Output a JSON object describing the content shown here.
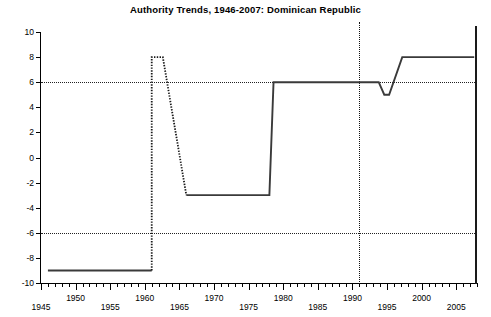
{
  "chart_data": {
    "type": "line",
    "title": "Authority Trends, 1946-2007: Dominican Republic",
    "xlabel": "",
    "ylabel": "",
    "xlim": [
      1945,
      2008
    ],
    "ylim": [
      -10,
      10
    ],
    "grid": "horizontal dotted at +6 and -6",
    "legend": "none",
    "y_ticks": [
      10,
      8,
      6,
      4,
      2,
      0,
      -2,
      -4,
      -6,
      -8,
      -10
    ],
    "y_tick_labels": [
      "10",
      "8",
      "6",
      "4",
      "2",
      "0",
      "-2",
      "-4",
      "-6",
      "-8",
      "-10"
    ],
    "x_ticks": [
      1945,
      1950,
      1955,
      1960,
      1965,
      1970,
      1975,
      1980,
      1985,
      1990,
      1995,
      2000,
      2005
    ],
    "x_tick_labels": [
      "1945",
      "1950",
      "1955",
      "1960",
      "1965",
      "1970",
      "1975",
      "1980",
      "1985",
      "1990",
      "1995",
      "2000",
      "2005"
    ],
    "x_minor_tick_interval": 1,
    "gridlines_y": [
      6,
      -6
    ],
    "annotations": [
      {
        "name": "event-vertical-line",
        "x": 1991,
        "style": "dotted",
        "label": ""
      }
    ],
    "series": [
      {
        "name": "Authority (Polity) score",
        "style": "step-line",
        "x": [
          1946,
          1961,
          1961,
          1962,
          1966,
          1978,
          1978,
          1994,
          1996,
          1998,
          2007
        ],
        "values": [
          -9,
          -9,
          8,
          8,
          -3,
          -3,
          6,
          6,
          5,
          8,
          8
        ],
        "segments": [
          {
            "style": "solid",
            "points": [
              [
                1946,
                -9
              ],
              [
                1961,
                -9
              ]
            ]
          },
          {
            "style": "dotted",
            "points": [
              [
                1961,
                -9
              ],
              [
                1961,
                8
              ],
              [
                1962,
                8
              ],
              [
                1962.6,
                8
              ],
              [
                1966,
                -3
              ]
            ]
          },
          {
            "style": "solid",
            "points": [
              [
                1966,
                -3
              ],
              [
                1978,
                -3
              ],
              [
                1978.6,
                6
              ],
              [
                1993.8,
                6
              ],
              [
                1994.6,
                5
              ],
              [
                1995.3,
                5
              ],
              [
                1997.2,
                8
              ],
              [
                2007.6,
                8
              ]
            ]
          }
        ]
      }
    ]
  }
}
